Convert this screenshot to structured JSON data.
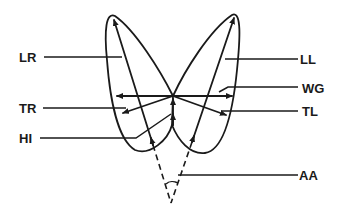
{
  "diagram": {
    "stroke_color": "#1a1a1a",
    "background": "#ffffff",
    "labels": {
      "LR": "LR",
      "LL": "LL",
      "WG": "WG",
      "TR": "TR",
      "TL": "TL",
      "HI": "HI",
      "AA": "AA"
    }
  }
}
